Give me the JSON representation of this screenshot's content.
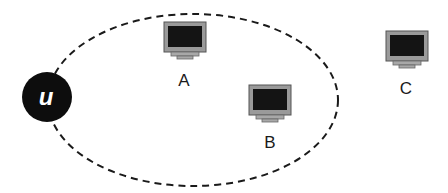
{
  "diagram": {
    "region": {
      "shape": "ellipse",
      "style": "dashed",
      "color": "#1a1a1a"
    },
    "user_node": {
      "label": "u",
      "fill": "#0d0d0d",
      "text_color": "#ffffff"
    },
    "computers": [
      {
        "id": "A",
        "label": "A",
        "inside_region": true
      },
      {
        "id": "B",
        "label": "B",
        "inside_region": true
      },
      {
        "id": "C",
        "label": "C",
        "inside_region": false
      }
    ],
    "colors": {
      "monitor_frame": "#9a9a9a",
      "monitor_screen": "#141414",
      "monitor_outline": "#555555"
    }
  }
}
